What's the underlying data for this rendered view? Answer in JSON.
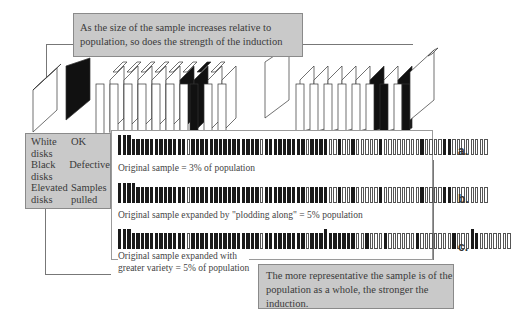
{
  "title_callout": {
    "line1": "As the size of the sample increases relative to",
    "line2": "population, so does the strength of the induction"
  },
  "legend": {
    "rows": [
      {
        "key": "White disks",
        "value": "OK"
      },
      {
        "key": "Black disks",
        "value": "Defective"
      },
      {
        "key": "Elevated disks",
        "value": "Samples pulled"
      }
    ],
    "r0k1": "White",
    "r0k2": "disks",
    "r0v": "OK",
    "r1k1": "Black",
    "r1k2": "disks",
    "r1v": "Defective",
    "r2k1": "Elevated",
    "r2k2": "disks",
    "r2v1": "Samples",
    "r2v2": "pulled"
  },
  "rows": [
    {
      "label": "a.",
      "caption": "Original sample = 3% of population",
      "pattern": "LLLbbbbbbbbbbbbwbbbbbbbbbbbbbbbwbbbbbbbbbwbbbbwwbwwbwwwwwbwwwwwwwwbwwwwbbwwwwwwww"
    },
    {
      "label": "b.",
      "caption": "Original sample expanded by \"plodding along\" = 5% population",
      "pattern": "LLLLbbbbbbbbbbbwbbbbbbbbbbbbbbbwbbbbbbbbbwbbbbwwbwwbwwwwwbwwwwwwwwbwwwwbbwwwwwwww"
    },
    {
      "label": "c.",
      "caption_line1": "Original sample expanded with",
      "caption_line2": "greater variety = 5% of population",
      "pattern": "LLLbbbbbbbbbbbbwbbbbbbbbbbbbbbbwbbbbbbbbbwbbbLbbbbbbwwbwwwbwwwwwwbwwwwwwwbwwwLbwwwwwww"
    }
  ],
  "conclusion_callout": {
    "line1": "The more representative the sample is of the",
    "line2": "population as a whole, the stronger the",
    "line3": "induction."
  },
  "colors": {
    "callout_bg": "#c9c9c9",
    "defective": "#1a1a1a",
    "ok": "#ffffff"
  }
}
